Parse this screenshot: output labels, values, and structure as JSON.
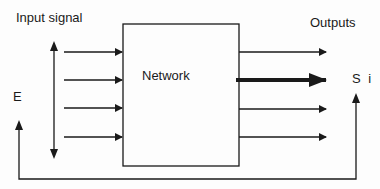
{
  "diagram": {
    "input_label": "Input signal",
    "output_label": "Outputs",
    "block_label": "Network",
    "error_label": "E",
    "output_symbol": "S i",
    "input_arrow_count": 4,
    "output_arrow_count": 4,
    "highlighted_output_index": 1,
    "line_color": "#1a1a1a",
    "background": "#fdfdfd"
  }
}
